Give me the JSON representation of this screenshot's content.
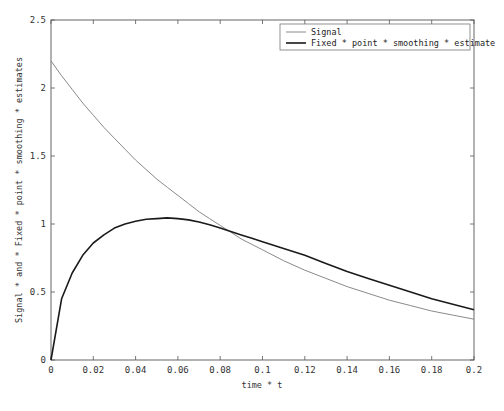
{
  "chart_data": {
    "type": "line",
    "title": "",
    "xlabel": "time * t",
    "ylabel": "Signal * and * Fixed * point * smoothing * estimates",
    "xlim": [
      0,
      0.2
    ],
    "ylim": [
      0,
      2.5
    ],
    "xticks": [
      "0",
      "0.02",
      "0.04",
      "0.06",
      "0.08",
      "0.1",
      "0.12",
      "0.14",
      "0.16",
      "0.18",
      "0.2"
    ],
    "yticks": [
      "0",
      "0.5",
      "1",
      "1.5",
      "2",
      "2.5"
    ],
    "grid": false,
    "legend_position": "upper right",
    "x": [
      0,
      0.005,
      0.01,
      0.015,
      0.02,
      0.025,
      0.03,
      0.035,
      0.04,
      0.045,
      0.05,
      0.055,
      0.06,
      0.065,
      0.07,
      0.075,
      0.08,
      0.085,
      0.09,
      0.095,
      0.1,
      0.11,
      0.12,
      0.13,
      0.14,
      0.15,
      0.16,
      0.17,
      0.18,
      0.19,
      0.2
    ],
    "series": [
      {
        "name": "Signal",
        "color": "#8a8a8a",
        "width": 1,
        "values": [
          2.2,
          2.09,
          1.99,
          1.89,
          1.8,
          1.71,
          1.63,
          1.55,
          1.47,
          1.4,
          1.33,
          1.27,
          1.21,
          1.15,
          1.09,
          1.04,
          0.99,
          0.94,
          0.89,
          0.85,
          0.81,
          0.73,
          0.66,
          0.6,
          0.54,
          0.49,
          0.44,
          0.4,
          0.36,
          0.33,
          0.3
        ]
      },
      {
        "name": "Fixed * point * smoothing * estimate",
        "color": "#1a1a1a",
        "width": 1.6,
        "values": [
          0.0,
          0.45,
          0.64,
          0.77,
          0.86,
          0.92,
          0.97,
          1.0,
          1.02,
          1.035,
          1.04,
          1.045,
          1.04,
          1.03,
          1.015,
          0.995,
          0.97,
          0.945,
          0.92,
          0.895,
          0.87,
          0.82,
          0.77,
          0.71,
          0.65,
          0.6,
          0.55,
          0.5,
          0.45,
          0.41,
          0.37
        ]
      }
    ]
  },
  "legend": {
    "items": [
      {
        "label": "Signal"
      },
      {
        "label": "Fixed * point * smoothing * estimate"
      }
    ]
  }
}
